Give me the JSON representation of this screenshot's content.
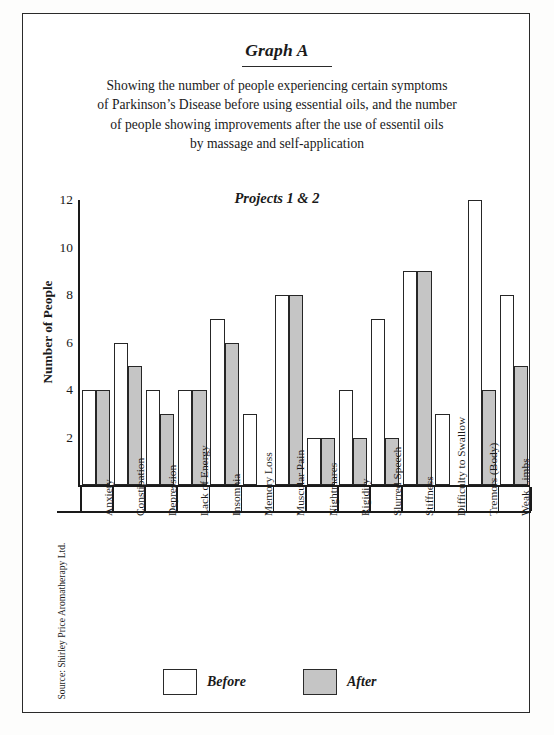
{
  "title": "Graph A",
  "caption_lines": [
    "Showing the number of people experiencing certain symptoms",
    "of Parkinson’s Disease before using essential oils, and the number",
    "of people showing improvements after the use of essentil oils",
    "by massage and self-application"
  ],
  "subtitle": "Projects 1 & 2",
  "source": "Source: Shirley Price Aromatherapy Ltd.",
  "legend": {
    "before_label": "Before",
    "after_label": "After",
    "before_color": "#ffffff",
    "after_color": "#c5c5c5"
  },
  "chart_data": {
    "type": "bar",
    "title": "Projects 1 & 2",
    "xlabel": "",
    "ylabel": "Number of People",
    "ylim": [
      0,
      12
    ],
    "yticks": [
      2,
      4,
      6,
      8,
      10,
      12
    ],
    "grid": false,
    "legend_position": "bottom",
    "categories": [
      "Anxiety",
      "Constipation",
      "Depression",
      "Lack of Energy",
      "Insomnia",
      "Memory Loss",
      "Muscular Pain",
      "Nightmares",
      "Rigidity",
      "Slurred Speech",
      "Stiffness",
      "Difficulty to Swallow",
      "Tremors (Body)",
      "Weak Limbs"
    ],
    "series": [
      {
        "name": "Before",
        "values": [
          4,
          6,
          4,
          4,
          7,
          3,
          8,
          2,
          4,
          7,
          9,
          3,
          12,
          8
        ]
      },
      {
        "name": "After",
        "values": [
          4,
          5,
          3,
          4,
          6,
          0,
          8,
          2,
          2,
          2,
          9,
          0,
          4,
          5
        ]
      }
    ]
  }
}
